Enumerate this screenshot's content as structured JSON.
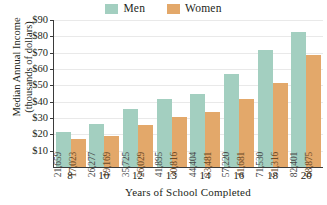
{
  "chart_data": {
    "type": "bar",
    "title": "",
    "xlabel": "Years of School Completed",
    "ylabel": "Median Annual Income (thousands of dollars)",
    "ylabel_line1": "Median Annual Income",
    "ylabel_line2": "(thousands of dollars)",
    "categories": [
      "8",
      "10",
      "12",
      "13",
      "14",
      "16",
      "18",
      "20"
    ],
    "series": [
      {
        "name": "Men",
        "color": "#a3cfc0",
        "values": [
          21659,
          26277,
          35725,
          41895,
          44404,
          57220,
          71530,
          82401
        ],
        "labels": [
          "21,659",
          "26,277",
          "35,725",
          "41,895",
          "44,404",
          "57,220",
          "71,530",
          "82,401"
        ]
      },
      {
        "name": "Women",
        "color": "#e3a86a",
        "values": [
          17023,
          19169,
          26029,
          30816,
          33481,
          41681,
          51316,
          68875
        ],
        "labels": [
          "17,023",
          "19,169",
          "26,029",
          "30,816",
          "33,481",
          "41,681",
          "51,316",
          "68,875"
        ]
      }
    ],
    "ylim": [
      0,
      90000
    ],
    "yticks": [
      10000,
      20000,
      30000,
      40000,
      50000,
      60000,
      70000,
      80000,
      90000
    ],
    "ytick_labels": [
      "$10",
      "$20",
      "$30",
      "$40",
      "$50",
      "$60",
      "$70",
      "$80",
      "$90"
    ],
    "grid": true,
    "legend_position": "top-center"
  },
  "legend": {
    "entries": [
      {
        "label": "Men",
        "color": "#a3cfc0"
      },
      {
        "label": "Women",
        "color": "#e3a86a"
      }
    ]
  }
}
